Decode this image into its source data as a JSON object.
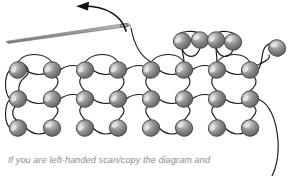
{
  "figure": {
    "caption": "If you are left-handed scan/copy the diagram and",
    "background_color": "#ffffff",
    "bead_fill_color": "#8a8a8a",
    "bead_outline_color": "#3f3f3f",
    "bead_highlight_color": "#d9d9d9",
    "thread_color": "#1a1a1a",
    "needle_color": "#a9a9a9",
    "caption_color": "#8d8d8d",
    "bead_radius": 8.6
  },
  "needle": {
    "label": "beading-needle",
    "tip_x": 6,
    "tip_y": 40,
    "eye_x": 131,
    "eye_y": 25
  },
  "arrow": {
    "label": "direction-arrow",
    "head_x": 78,
    "head_y": 7,
    "start_x": 126,
    "start_y": 30,
    "direction": "left"
  },
  "beads": {
    "top_row": [
      {
        "x": 182,
        "y": 41
      },
      {
        "x": 200,
        "y": 40
      },
      {
        "x": 216,
        "y": 40
      },
      {
        "x": 233,
        "y": 42
      }
    ],
    "upper_row": [
      {
        "x": 18,
        "y": 70
      },
      {
        "x": 52,
        "y": 70
      },
      {
        "x": 85,
        "y": 70
      },
      {
        "x": 118,
        "y": 70
      },
      {
        "x": 151,
        "y": 70
      },
      {
        "x": 184,
        "y": 70
      },
      {
        "x": 217,
        "y": 70
      },
      {
        "x": 250,
        "y": 70
      }
    ],
    "middle_row": [
      {
        "x": 18,
        "y": 99
      },
      {
        "x": 52,
        "y": 99
      },
      {
        "x": 85,
        "y": 99
      },
      {
        "x": 118,
        "y": 99
      },
      {
        "x": 151,
        "y": 99
      },
      {
        "x": 184,
        "y": 99
      },
      {
        "x": 217,
        "y": 99
      },
      {
        "x": 250,
        "y": 99
      }
    ],
    "bottom_row": [
      {
        "x": 18,
        "y": 128
      },
      {
        "x": 52,
        "y": 128
      },
      {
        "x": 85,
        "y": 128
      },
      {
        "x": 118,
        "y": 128
      },
      {
        "x": 151,
        "y": 128
      },
      {
        "x": 184,
        "y": 128
      },
      {
        "x": 217,
        "y": 128
      },
      {
        "x": 250,
        "y": 128
      }
    ],
    "added_bead": {
      "x": 277,
      "y": 48,
      "label": "new-bead"
    }
  }
}
